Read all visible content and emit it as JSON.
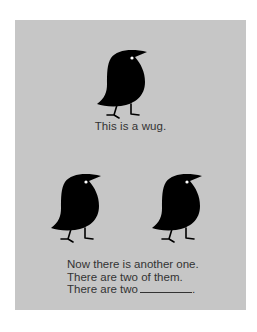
{
  "card": {
    "background": "#c6c6c6",
    "caption": "This is a wug.",
    "lines": [
      "Now there is another one.",
      "There are two of them.",
      "There are two"
    ],
    "blank_suffix": "."
  },
  "figures": [
    {
      "name": "wug",
      "count_position": "single"
    },
    {
      "name": "wug",
      "count_position": "left"
    },
    {
      "name": "wug",
      "count_position": "right"
    }
  ]
}
